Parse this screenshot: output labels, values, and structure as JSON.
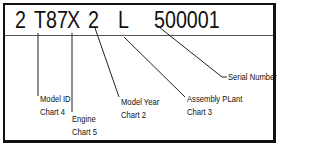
{
  "vin_code": {
    "segments": [
      {
        "id": "country",
        "text": "2"
      },
      {
        "id": "model",
        "text": "T87"
      },
      {
        "id": "engine",
        "text": "X"
      },
      {
        "id": "year",
        "text": "2"
      },
      {
        "id": "plant",
        "text": "L"
      },
      {
        "id": "serial",
        "text": "500001"
      }
    ]
  },
  "labels": {
    "model_id": {
      "line1": "Model ID",
      "line2": "Chart 4"
    },
    "engine": {
      "line1": "Engine",
      "line2": "Chart 5"
    },
    "model_year": {
      "line1": "Model Year",
      "line2": "Chart 2"
    },
    "assembly_plant": {
      "line1": "Assembly PLant",
      "line2": "Chart 3"
    },
    "serial_number": {
      "line1": "Serial Number"
    }
  }
}
